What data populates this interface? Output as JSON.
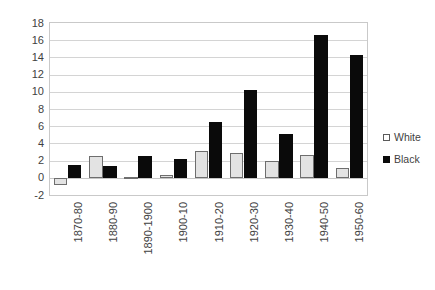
{
  "chart_data": {
    "type": "bar",
    "title": "",
    "subtitle": "",
    "xlabel": "",
    "ylabel": "",
    "categories": [
      "1870-80",
      "1880-90",
      "1890-1900",
      "1900-10",
      "1910-20",
      "1920-30",
      "1930-40",
      "1940-50",
      "1950-60"
    ],
    "series": [
      {
        "name": "White",
        "color": "#e3e3e3",
        "values": [
          -0.8,
          2.5,
          0.1,
          0.3,
          3.1,
          2.9,
          1.9,
          2.6,
          1.1
        ]
      },
      {
        "name": "Black",
        "color": "#0a0a0a",
        "values": [
          1.5,
          1.4,
          2.5,
          2.2,
          6.5,
          10.2,
          5.1,
          16.6,
          14.3
        ]
      }
    ],
    "ylim": [
      -2,
      18
    ],
    "yticks": [
      -2,
      0,
      2,
      4,
      6,
      8,
      10,
      12,
      14,
      16,
      18
    ],
    "ytick_labels": [
      "-2",
      "0",
      "2",
      "4",
      "6",
      "8",
      "10",
      "12",
      "14",
      "16",
      "18"
    ],
    "grid": true,
    "grid_axis": "y",
    "legend_position": "right",
    "legend": [
      {
        "label": "White",
        "swatch": "white-square-outline"
      },
      {
        "label": "Black",
        "swatch": "black-square-filled"
      }
    ]
  }
}
